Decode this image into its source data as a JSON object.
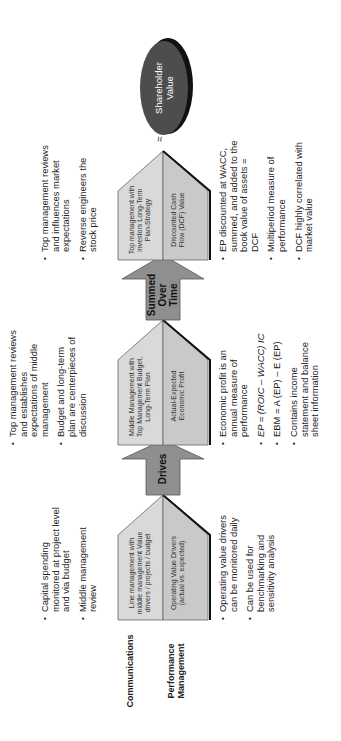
{
  "rows": {
    "communications": "Communications",
    "performance": "Performance Management"
  },
  "stages": [
    {
      "top_box": "Line management with middle management Value drivers / projects / budget",
      "bottom_box": "Operating Value Drivers (actual vs. expected)",
      "communications_bullets": [
        "Capital spending monitored at project level and via budget",
        "Middle management review"
      ],
      "performance_bullets": [
        "Operating value drivers can be monitored daily",
        "Can be used for benchmarking and sensitivity analysis"
      ]
    },
    {
      "top_box": "Middle Management with Top Management Budget, Long-Term Plan",
      "bottom_box": "Actual-Expected Economic Profit",
      "communications_bullets": [
        "Top management reviews and establishes expectations of middle management",
        "Budget and long-term plan are centerpieces of discussion"
      ],
      "performance_bullets": [
        "Economic profit is an annual measure of performance",
        "EP = (ROIC – WACC) IC",
        "EBM = A (EP) – E (EP)",
        "Contains income statement and balance sheet information"
      ]
    },
    {
      "top_box": "Top management with investors Long-Term Plan-Strategy",
      "bottom_box": "Discounted Cash Flow (DCF) Value",
      "communications_bullets": [
        "Top management reviews and influences market expectations",
        "Reverse engineers the stock price"
      ],
      "performance_bullets": [
        "EP discounted at WACC, summed, and added to the book value of assets = DCF",
        "Multiperiod measure of performance",
        "DCF highly correlated with market value"
      ]
    }
  ],
  "arrows": [
    "Drives",
    "Summed Over Time"
  ],
  "goal": "Shareholder Value",
  "approx_symbol": "≈",
  "colors": {
    "box_top": "#d9d9d9",
    "box_bottom": "#c8c8c8",
    "arrow": "#8c8c8c",
    "goal": "#4d4d4d",
    "shadow": "#111111"
  }
}
